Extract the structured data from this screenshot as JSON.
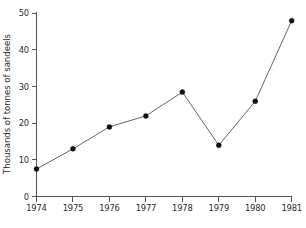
{
  "chart_data": {
    "type": "line",
    "title": "",
    "subtitle": "",
    "xlabel": "",
    "ylabel": "Thousands of tonnes of sandeels",
    "categories": [
      "1974",
      "1975",
      "1976",
      "1977",
      "1978",
      "1979",
      "1980",
      "1981"
    ],
    "x": [
      1974,
      1975,
      1976,
      1977,
      1978,
      1979,
      1980,
      1981
    ],
    "values": [
      7.5,
      13,
      19,
      22,
      28.5,
      14,
      26,
      48
    ],
    "series": [
      {
        "name": "Sandeel landings",
        "values": [
          7.5,
          13,
          19,
          22,
          28.5,
          14,
          26,
          48
        ]
      }
    ],
    "ylim": [
      0,
      50
    ],
    "yticks": [
      0,
      10,
      20,
      30,
      40,
      50
    ],
    "ytick_labels": [
      "0",
      "10",
      "20",
      "30",
      "40",
      "50"
    ],
    "xtick_labels": [
      "1974",
      "1975",
      "1976",
      "1977",
      "1978",
      "1979",
      "1980",
      "1981"
    ],
    "grid": false,
    "legend": false,
    "legend_position": "none",
    "marker": "filled-circle",
    "line_color": "#4a4a4a",
    "marker_color": "#121212",
    "axis_color": "#555555",
    "background_color": "#ffffff"
  },
  "figure": {
    "y_axis_title": "Thousands of tonnes of sandeels"
  }
}
